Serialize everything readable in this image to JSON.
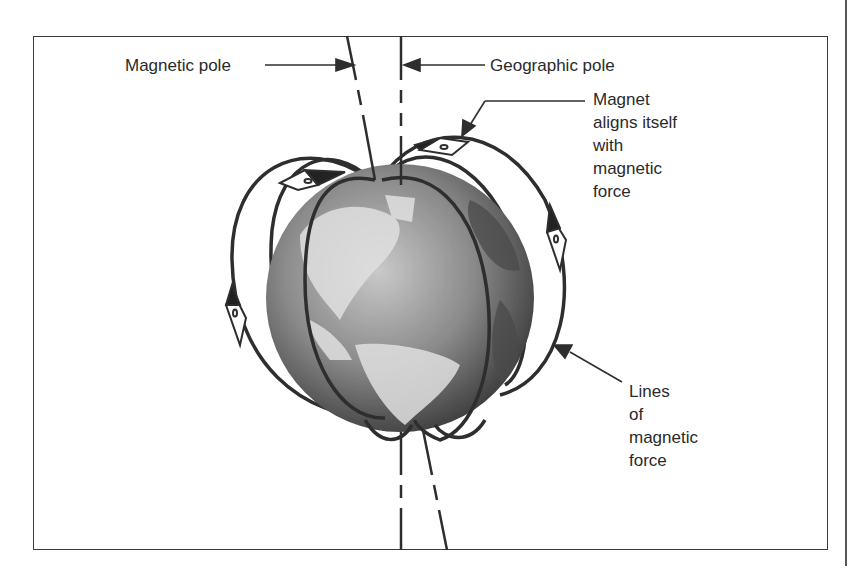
{
  "diagram": {
    "labels": {
      "magnetic_pole": "Magnetic pole",
      "geographic_pole": "Geographic pole",
      "magnet_aligns": "Magnet\naligns itself\nwith\nmagnetic\nforce",
      "lines_of_force": "Lines\nof\nmagnetic\nforce"
    },
    "elements": [
      "globe",
      "geographic-axis",
      "magnetic-axis",
      "field-lines",
      "compass-needles"
    ],
    "colors": {
      "line": "#2e2e2e",
      "globe_dark": "#3c3c3c",
      "globe_light": "#bdbdbd",
      "land": "#e2e2e2",
      "frame": "#3a3a3a"
    }
  }
}
